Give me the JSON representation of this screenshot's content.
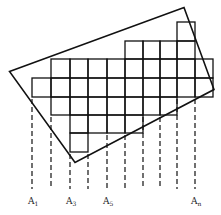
{
  "diagram": {
    "type": "tiled-grid-in-rotated-rectangle",
    "outer_rectangle": {
      "corners": [
        [
          9.5,
          71.5
        ],
        [
          184,
          7.5
        ],
        [
          214,
          89.5
        ],
        [
          75,
          162.5
        ]
      ],
      "stroke": "#111111"
    },
    "grid": {
      "column_edges_x": [
        32,
        51,
        70,
        88,
        107,
        125,
        143,
        160,
        177,
        195
      ],
      "row_edges_y": [
        22,
        41,
        59,
        78,
        97,
        115,
        133,
        152
      ],
      "rows": [
        {
          "row": 0,
          "cols": [
            8,
            8
          ]
        },
        {
          "row": 1,
          "cols": [
            5,
            8
          ]
        },
        {
          "row": 2,
          "cols": [
            1,
            9
          ]
        },
        {
          "row": 3,
          "cols": [
            0,
            9
          ]
        },
        {
          "row": 4,
          "cols": [
            1,
            7
          ]
        },
        {
          "row": 5,
          "cols": [
            2,
            5
          ]
        },
        {
          "row": 6,
          "cols": [
            2,
            2
          ]
        }
      ],
      "stroke": "#111111"
    },
    "projection_lines": {
      "style": "dashed",
      "end_y": 189,
      "lines": [
        {
          "x": 32,
          "start_y": 97
        },
        {
          "x": 51,
          "start_y": 115
        },
        {
          "x": 70,
          "start_y": 152
        },
        {
          "x": 88,
          "start_y": 152
        },
        {
          "x": 107,
          "start_y": 133
        },
        {
          "x": 125,
          "start_y": 133
        },
        {
          "x": 143,
          "start_y": 115
        },
        {
          "x": 160,
          "start_y": 115
        },
        {
          "x": 177,
          "start_y": 97
        },
        {
          "x": 195,
          "start_y": 97
        }
      ]
    },
    "labels": [
      {
        "base": "A",
        "sub": "1",
        "x": 32
      },
      {
        "base": "A",
        "sub": "3",
        "x": 70
      },
      {
        "base": "A",
        "sub": "5",
        "x": 107
      },
      {
        "base": "A",
        "sub": "n",
        "x": 195
      }
    ]
  }
}
